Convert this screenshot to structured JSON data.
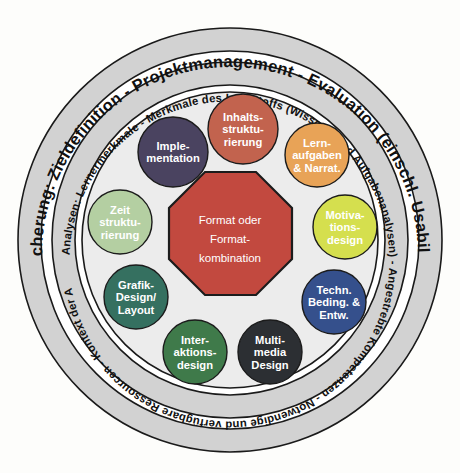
{
  "diagram": {
    "outer_ring": {
      "name": "qualitaetssicherung-ring",
      "text": "Qualitätssicherung: Zieldefinition - Projektmanagement - Evaluation (einschl. Usability-Testing)",
      "fill": "#d2d2d2",
      "stroke": "#1a1a1a"
    },
    "middle_ring": {
      "name": "analysen-ring",
      "text": "Analysen: Lernermerkmale - Merkmale des Lehrstoffs (Wissens- und Aufgabenanalysen) - Angestrebte Kompetenzen - Notwendige und verfügbare Ressourcen - Kontext der Anwendung",
      "fill": "#d2d2d2",
      "stroke": "#1a1a1a"
    },
    "gap_ring": {
      "name": "white-separator-ring",
      "fill": "#ffffff",
      "stroke": "#1a1a1a"
    },
    "inner_disc": {
      "name": "inner-disc",
      "fill": "#ececec",
      "stroke": "#1a1a1a"
    },
    "center": {
      "name": "format-octagon",
      "shape": "octagon",
      "fill": "#c2493f",
      "stroke": "#1c1c1c",
      "lines": [
        "Format oder",
        "Format-",
        "kombination"
      ]
    },
    "nodes": [
      {
        "id": "inhaltsstrukturierung",
        "lines": [
          "Inhalts-",
          "struktu-",
          "rierung"
        ],
        "color": "#c2634e",
        "cx": 243,
        "cy": 129,
        "r": 35,
        "text_color": "#1b1b1b"
      },
      {
        "id": "lernaufgaben-narrat",
        "lines": [
          "Lern-",
          "aufgaben",
          "& Narrat."
        ],
        "color": "#e8a357",
        "cx": 317,
        "cy": 155,
        "r": 32,
        "text_color": "#1b1b1b"
      },
      {
        "id": "motivationsdesign",
        "lines": [
          "Motiva-",
          "tions-",
          "design"
        ],
        "color": "#d5df4e",
        "cx": 345,
        "cy": 227,
        "r": 32,
        "text_color": "#1b1b1b"
      },
      {
        "id": "techn-beding-entw",
        "lines": [
          "Techn.",
          "Beding. &",
          "Entw."
        ],
        "color": "#35508c",
        "cx": 334,
        "cy": 302,
        "r": 32,
        "text_color": "#ffffff"
      },
      {
        "id": "multimedia-design",
        "lines": [
          "Multi-",
          "media",
          "Design"
        ],
        "color": "#2c2f33",
        "cx": 270,
        "cy": 352,
        "r": 32,
        "text_color": "#ffffff"
      },
      {
        "id": "interaktionsdesign",
        "lines": [
          "Inter-",
          "aktions-",
          "design"
        ],
        "color": "#3f7a4a",
        "cx": 195,
        "cy": 352,
        "r": 32,
        "text_color": "#ffffff"
      },
      {
        "id": "grafik-design-layout",
        "lines": [
          "Grafik-",
          "Design/",
          "Layout"
        ],
        "color": "#357060",
        "cx": 136,
        "cy": 297,
        "r": 32,
        "text_color": "#ffffff"
      },
      {
        "id": "zeitstrukturierung",
        "lines": [
          "Zeit",
          "struktu-",
          "rierung"
        ],
        "color": "#b4cfa2",
        "cx": 120,
        "cy": 222,
        "r": 32,
        "text_color": "#1b1b1b"
      },
      {
        "id": "implementation",
        "lines": [
          "Imple-",
          "mentation"
        ],
        "color": "#4a4360",
        "cx": 173,
        "cy": 152,
        "r": 35,
        "text_color": "#ffffff"
      }
    ]
  },
  "background_text": {
    "note": "faint bleed-through print text behind the figure",
    "lines": [
      "Die Entwicklung von Lernmedien ist",
      "ein komplexer Prozess, der in",
      "mehreren Phasen abläuft und",
      "zahlreiche Entscheidungen verlangt.",
      "Die nebenstehende Abbildung zeigt",
      "die wichtigsten Dimensionen der",
      "didaktischen Gestaltung im",
      "Überblick und ordnet sie einander zu."
    ]
  }
}
